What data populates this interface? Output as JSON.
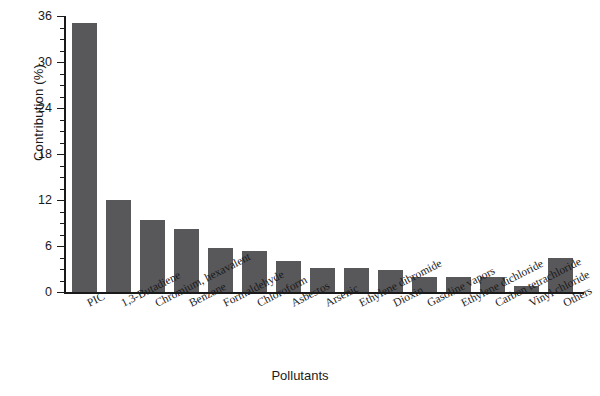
{
  "chart_data": {
    "type": "bar",
    "title": "",
    "xlabel": "Pollutants",
    "ylabel": "Contribution (%)",
    "categories": [
      "PIC",
      "1,3-Butadiene",
      "Chromium, hexavalent",
      "Benzene",
      "Formaldehyde",
      "Chloroform",
      "Asbestos",
      "Arsenic",
      "Ethylene dibromide",
      "Dioxin",
      "Gasoline vapors",
      "Ethylene dichloride",
      "Carbon tetrachloride",
      "Vinyl chloride",
      "Others"
    ],
    "values": [
      35.1,
      12.0,
      9.4,
      8.2,
      5.8,
      5.4,
      4.0,
      3.1,
      3.1,
      2.9,
      2.0,
      1.9,
      1.9,
      0.8,
      4.5
    ],
    "ylim": [
      0,
      36
    ],
    "yticks": [
      0,
      6,
      12,
      18,
      24,
      30,
      36
    ],
    "ytick_labels": [
      "0",
      "6",
      "12",
      "18",
      "24",
      "30",
      "36"
    ],
    "yminor_step": 1.5,
    "grid": false,
    "legend": false,
    "bar_color": "#58585a",
    "axis_color": "#1a1a1a",
    "background": "#ffffff"
  }
}
